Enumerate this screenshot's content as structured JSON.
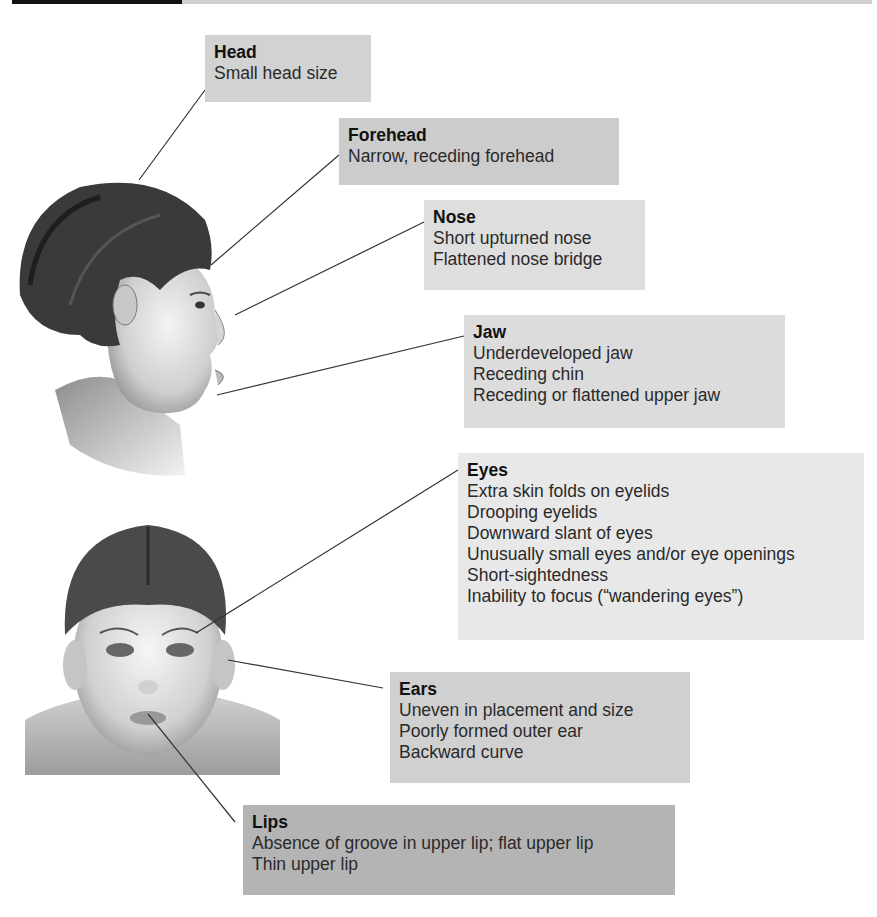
{
  "colors": {
    "box_light": "#e6e6e6",
    "box_medium": "#d2d2d2",
    "box_dark": "#b9b9b9",
    "leader_line": "#333333"
  },
  "illustrations": {
    "profile": "child-face-profile",
    "front": "child-face-front"
  },
  "callouts": [
    {
      "id": "head",
      "title": "Head",
      "lines": [
        "Small head size"
      ]
    },
    {
      "id": "forehead",
      "title": "Forehead",
      "lines": [
        "Narrow, receding forehead"
      ]
    },
    {
      "id": "nose",
      "title": "Nose",
      "lines": [
        "Short upturned nose",
        "Flattened nose bridge"
      ]
    },
    {
      "id": "jaw",
      "title": "Jaw",
      "lines": [
        "Underdeveloped jaw",
        "Receding chin",
        "Receding or flattened upper jaw"
      ]
    },
    {
      "id": "eyes",
      "title": "Eyes",
      "lines": [
        "Extra skin folds on eyelids",
        "Drooping eyelids",
        "Downward slant of eyes",
        "Unusually small eyes and/or eye openings",
        "Short-sightedness",
        "Inability to focus (“wandering eyes”)"
      ]
    },
    {
      "id": "ears",
      "title": "Ears",
      "lines": [
        "Uneven in placement and size",
        "Poorly formed outer ear",
        "Backward curve"
      ]
    },
    {
      "id": "lips",
      "title": "Lips",
      "lines": [
        "Absence of groove in upper lip; flat upper lip",
        "Thin upper lip"
      ]
    }
  ]
}
